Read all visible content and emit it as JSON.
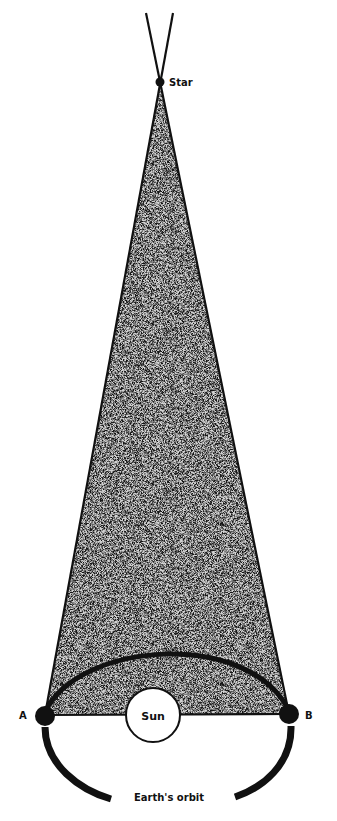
{
  "diagram": {
    "type": "stellar-parallax",
    "labels": {
      "star": "Star",
      "sun": "Sun",
      "point_a": "A",
      "point_b": "B",
      "orbit": "Earth's orbit"
    },
    "colors": {
      "ink": "#111111",
      "fill_stipple": "#b8b8b8",
      "background": "#ffffff"
    }
  }
}
